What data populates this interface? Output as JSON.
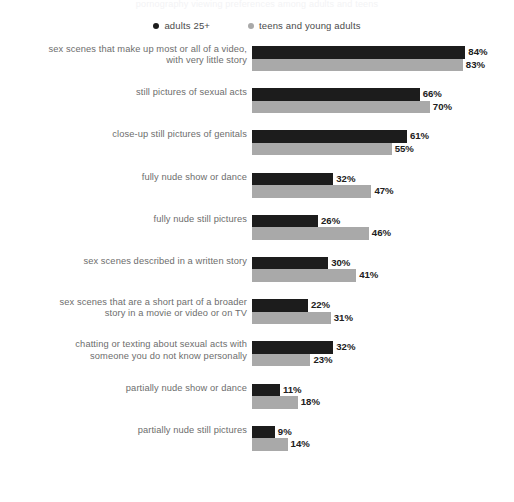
{
  "title_remnant": "pornography viewing preferences among adults and teens",
  "legend": {
    "items": [
      {
        "label": "adults 25+",
        "color": "#1c1c1c",
        "dot": "legend-dot-dark"
      },
      {
        "label": "teens and young adults",
        "color": "#a9a9a9",
        "dot": "legend-dot-light"
      }
    ]
  },
  "chart_data": {
    "type": "bar",
    "orientation": "horizontal",
    "title": "",
    "xlabel": "",
    "ylabel": "",
    "xlim": [
      0,
      100
    ],
    "grid": false,
    "legend_position": "top-center",
    "value_suffix": "%",
    "categories": [
      "sex scenes that make up most or all of a video,\nwith very little story",
      "still pictures of sexual acts",
      "close-up still pictures of genitals",
      "fully nude show or dance",
      "fully nude still pictures",
      "sex scenes described in a written story",
      "sex scenes that are a short part of a broader\nstory in a movie or video or on TV",
      "chatting or texting about sexual acts with\nsomeone you do not know personally",
      "partially nude show or dance",
      "partially nude still pictures"
    ],
    "series": [
      {
        "name": "adults 25+",
        "color": "#1c1c1c",
        "values": [
          84,
          66,
          61,
          32,
          26,
          30,
          22,
          32,
          11,
          9
        ],
        "labels": [
          "84%",
          "66%",
          "61%",
          "32%",
          "26%",
          "30%",
          "22%",
          "32%",
          "11%",
          "9%"
        ]
      },
      {
        "name": "teens and young adults",
        "color": "#a9a9a9",
        "values": [
          83,
          70,
          55,
          47,
          46,
          41,
          31,
          23,
          18,
          14
        ],
        "labels": [
          "83%",
          "70%",
          "55%",
          "47%",
          "46%",
          "41%",
          "31%",
          "23%",
          "18%",
          "14%"
        ]
      }
    ]
  }
}
